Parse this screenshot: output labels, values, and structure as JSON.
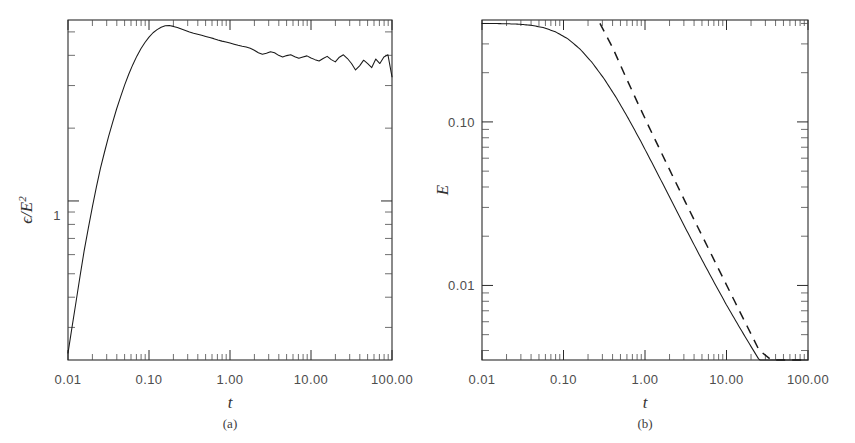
{
  "figure": {
    "background_color": "#ffffff",
    "line_color": "#1a1a1a",
    "panels": [
      {
        "id": "a",
        "caption": "(a)",
        "xlabel": "t",
        "ylabel_numerator": "ϵ",
        "ylabel_slash": "/",
        "ylabel_denominator": "E",
        "ylabel_exponent": "2",
        "ylabel_plain": "ϵ/E²"
      },
      {
        "id": "b",
        "caption": "(b)",
        "xlabel": "t",
        "ylabel_plain": "E"
      }
    ]
  },
  "chart_data": [
    {
      "type": "line",
      "panel": "a",
      "title": "",
      "xlabel": "t",
      "ylabel": "ϵ/E²",
      "xscale": "log",
      "yscale": "log",
      "xlim": [
        0.01,
        100.0
      ],
      "ylim": [
        0.22,
        5.6
      ],
      "grid": false,
      "legend": null,
      "xticklabels": [
        "0.01",
        "0.10",
        "1.00",
        "10.00",
        "100.00"
      ],
      "xtickvalues": [
        0.01,
        0.1,
        1.0,
        10.0,
        100.0
      ],
      "yticklabels": [
        "1"
      ],
      "ytickvalues": [
        1.0
      ],
      "series": [
        {
          "name": "dissipation-ratio",
          "style": "solid",
          "x": [
            0.01,
            0.0112,
            0.0126,
            0.0141,
            0.0158,
            0.0178,
            0.02,
            0.0224,
            0.0251,
            0.0282,
            0.0316,
            0.0355,
            0.0398,
            0.0447,
            0.0501,
            0.0562,
            0.0631,
            0.0708,
            0.0794,
            0.0891,
            0.1,
            0.1122,
            0.1259,
            0.1413,
            0.1585,
            0.1778,
            0.1995,
            0.2239,
            0.2512,
            0.2818,
            0.3162,
            0.3548,
            0.3981,
            0.4467,
            0.5012,
            0.5623,
            0.631,
            0.7079,
            0.7943,
            0.8913,
            1.0,
            1.122,
            1.2589,
            1.4125,
            1.5849,
            1.7783,
            1.9953,
            2.2387,
            2.5119,
            2.8184,
            3.1623,
            3.5481,
            3.9811,
            4.4668,
            5.0119,
            5.6234,
            6.3096,
            7.0795,
            7.9433,
            8.9125,
            10.0,
            11.22,
            12.589,
            14.125,
            15.849,
            17.783,
            19.953,
            22.387,
            25.119,
            28.184,
            31.623,
            35.481,
            39.811,
            44.668,
            50.119,
            56.234,
            63.096,
            70.795,
            79.433,
            89.125,
            100.0
          ],
          "y": [
            0.235,
            0.3,
            0.385,
            0.49,
            0.62,
            0.77,
            0.945,
            1.14,
            1.36,
            1.59,
            1.84,
            2.11,
            2.4,
            2.7,
            3.02,
            3.34,
            3.66,
            3.97,
            4.26,
            4.52,
            4.76,
            4.96,
            5.11,
            5.23,
            5.3,
            5.31,
            5.27,
            5.21,
            5.14,
            5.07,
            5.0,
            4.94,
            4.89,
            4.84,
            4.79,
            4.74,
            4.69,
            4.63,
            4.58,
            4.54,
            4.5,
            4.45,
            4.4,
            4.36,
            4.33,
            4.28,
            4.2,
            4.1,
            4.04,
            4.08,
            4.14,
            4.1,
            4.0,
            3.94,
            3.99,
            4.02,
            3.95,
            3.89,
            3.94,
            3.98,
            3.9,
            3.84,
            3.79,
            3.88,
            3.96,
            3.84,
            3.76,
            3.93,
            4.02,
            3.88,
            3.7,
            3.48,
            3.62,
            3.82,
            3.7,
            3.56,
            3.86,
            3.7,
            3.94,
            4.02,
            3.26
          ]
        }
      ]
    },
    {
      "type": "line",
      "panel": "b",
      "title": "",
      "xlabel": "t",
      "ylabel": "E",
      "xscale": "log",
      "yscale": "log",
      "xlim": [
        0.01,
        100.0
      ],
      "ylim": [
        0.0035,
        0.42
      ],
      "grid": false,
      "legend": null,
      "xticklabels": [
        "0.01",
        "0.10",
        "1.00",
        "10.00",
        "100.00"
      ],
      "xtickvalues": [
        0.01,
        0.1,
        1.0,
        10.0,
        100.0
      ],
      "yticklabels": [
        "0.10",
        "0.01"
      ],
      "ytickvalues": [
        0.1,
        0.01
      ],
      "series": [
        {
          "name": "energy-decay",
          "style": "solid",
          "x": [
            0.01,
            0.0141,
            0.02,
            0.0282,
            0.0398,
            0.0562,
            0.0794,
            0.1122,
            0.1585,
            0.2239,
            0.3162,
            0.4467,
            0.631,
            0.8913,
            1.2589,
            1.7783,
            2.5119,
            3.5481,
            5.0119,
            7.0795,
            10.0,
            14.125,
            19.953,
            28.184,
            39.811,
            56.234,
            79.433,
            100.0
          ],
          "y": [
            0.4,
            0.3995,
            0.3985,
            0.396,
            0.39,
            0.378,
            0.356,
            0.323,
            0.28,
            0.231,
            0.183,
            0.14,
            0.104,
            0.0758,
            0.0545,
            0.039,
            0.0278,
            0.0199,
            0.0143,
            0.0104,
            0.0076,
            0.00565,
            0.00424,
            0.0032,
            0.00244,
            0.00188,
            0.00147,
            0.00128
          ]
        },
        {
          "name": "power-law-asymptote",
          "style": "dashed",
          "x": [
            0.28,
            0.4,
            0.5623,
            0.7943,
            1.122,
            1.5849,
            2.2387,
            3.1623,
            4.4668,
            6.3096,
            8.9125,
            12.589,
            17.783,
            25.119,
            35.481,
            50.119,
            70.795,
            100.0
          ],
          "y": [
            0.4,
            0.285,
            0.195,
            0.134,
            0.093,
            0.065,
            0.0455,
            0.032,
            0.0226,
            0.016,
            0.0113,
            0.008,
            0.00567,
            0.00402,
            0.00285,
            0.00202,
            0.00144,
            0.00128
          ]
        }
      ]
    }
  ]
}
